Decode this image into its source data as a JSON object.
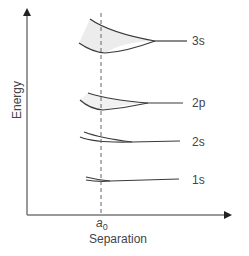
{
  "diagram": {
    "y_axis_label": "Energy",
    "x_axis_label": "Separation",
    "marker_label_base": "a",
    "marker_label_sub": "0",
    "levels": [
      {
        "label": "3s"
      },
      {
        "label": "2p"
      },
      {
        "label": "2s"
      },
      {
        "label": "1s"
      }
    ],
    "colors": {
      "axis": "#555555",
      "curve": "#3a3a3a",
      "shade": "#ececec",
      "dashed": "#666666",
      "text": "#444444"
    }
  }
}
